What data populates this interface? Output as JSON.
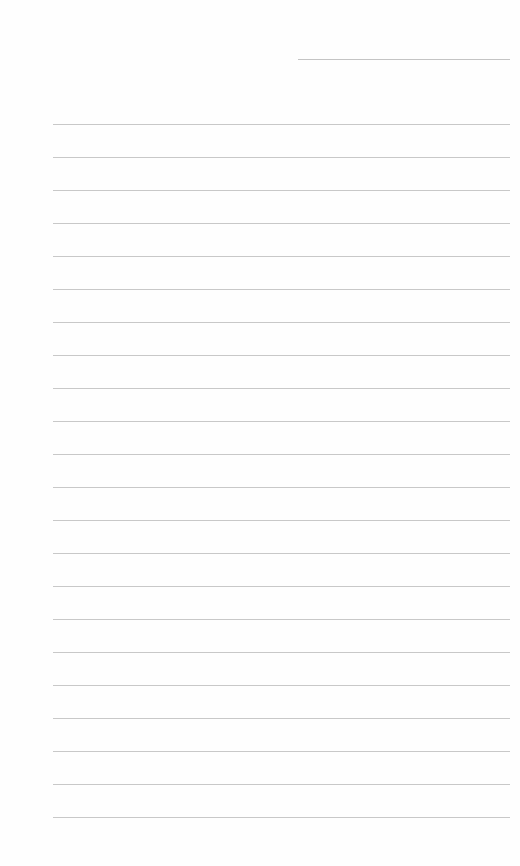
{
  "page": {
    "type": "lined-paper",
    "background_color": "#fefefe",
    "line_color": "#c8c8c8"
  },
  "header": {
    "date_line": {
      "label": "",
      "x": 298,
      "y": 59,
      "width": 212
    }
  },
  "ruled_lines": {
    "count": 22,
    "first_y": 124,
    "spacing": 33,
    "x_start": 53,
    "x_end": 510,
    "lines": [
      {
        "index": 1,
        "text": ""
      },
      {
        "index": 2,
        "text": ""
      },
      {
        "index": 3,
        "text": ""
      },
      {
        "index": 4,
        "text": ""
      },
      {
        "index": 5,
        "text": ""
      },
      {
        "index": 6,
        "text": ""
      },
      {
        "index": 7,
        "text": ""
      },
      {
        "index": 8,
        "text": ""
      },
      {
        "index": 9,
        "text": ""
      },
      {
        "index": 10,
        "text": ""
      },
      {
        "index": 11,
        "text": ""
      },
      {
        "index": 12,
        "text": ""
      },
      {
        "index": 13,
        "text": ""
      },
      {
        "index": 14,
        "text": ""
      },
      {
        "index": 15,
        "text": ""
      },
      {
        "index": 16,
        "text": ""
      },
      {
        "index": 17,
        "text": ""
      },
      {
        "index": 18,
        "text": ""
      },
      {
        "index": 19,
        "text": ""
      },
      {
        "index": 20,
        "text": ""
      },
      {
        "index": 21,
        "text": ""
      },
      {
        "index": 22,
        "text": ""
      }
    ]
  }
}
